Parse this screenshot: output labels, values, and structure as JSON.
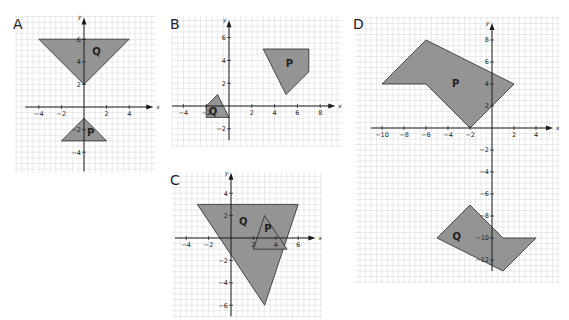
{
  "style": {
    "shape_fill": "#8e8e8e",
    "shape_stroke": "#2a2a2a",
    "grid_color": "#dcdcdc",
    "axis_color": "#1a1a1a",
    "text_color": "#222222"
  },
  "chart_data": [
    {
      "type": "diagram",
      "title": "A",
      "box": {
        "left": 15,
        "top": 16,
        "width": 141,
        "height": 157
      },
      "origin_px": [
        84,
        107
      ],
      "unit_px": 11.3,
      "grid_range": {
        "x": [
          -6,
          6
        ],
        "y": [
          -6,
          8
        ]
      },
      "x_ticks": [
        -4,
        -2,
        2,
        4
      ],
      "y_ticks": [
        6,
        4,
        2,
        -2,
        -4
      ],
      "axis_extent": {
        "x": [
          -5.2,
          5.6
        ],
        "y": [
          -5.7,
          7.4
        ]
      },
      "xlabel": "x",
      "ylabel": "y",
      "shapes": [
        {
          "label": "Q",
          "points": [
            [
              -4,
              6
            ],
            [
              4,
              6
            ],
            [
              0,
              2
            ]
          ],
          "label_pos": [
            1.1,
            4.6
          ]
        },
        {
          "label": "P",
          "points": [
            [
              0,
              -1
            ],
            [
              2,
              -3
            ],
            [
              -2,
              -3
            ]
          ],
          "label_pos": [
            0.6,
            -2.6
          ]
        }
      ]
    },
    {
      "type": "diagram",
      "title": "B",
      "box": {
        "left": 172,
        "top": 16,
        "width": 170,
        "height": 131
      },
      "origin_px": [
        229,
        106
      ],
      "unit_px": 11.4,
      "grid_range": {
        "x": [
          -5,
          10
        ],
        "y": [
          -4,
          8
        ]
      },
      "x_ticks": [
        -4,
        -2,
        2,
        4,
        6,
        8
      ],
      "y_ticks": [
        6,
        4,
        2,
        -2
      ],
      "axis_extent": {
        "x": [
          -5,
          8.8
        ],
        "y": [
          -3,
          7
        ]
      },
      "xlabel": "x",
      "ylabel": "y",
      "shapes": [
        {
          "label": "P",
          "points": [
            [
              3,
              5
            ],
            [
              7,
              5
            ],
            [
              7,
              3
            ],
            [
              5,
              1
            ]
          ],
          "label_pos": [
            5.3,
            3.4
          ]
        },
        {
          "label": "Q",
          "points": [
            [
              -2,
              0
            ],
            [
              -1,
              1
            ],
            [
              0,
              -1
            ],
            [
              -2,
              -1
            ]
          ],
          "label_pos": [
            -1.4,
            -0.8
          ]
        }
      ]
    },
    {
      "type": "diagram",
      "title": "C",
      "box": {
        "left": 172,
        "top": 172,
        "width": 150,
        "height": 146
      },
      "origin_px": [
        231,
        238
      ],
      "unit_px": 11.2,
      "grid_range": {
        "x": [
          -6,
          9
        ],
        "y": [
          -8,
          6
        ]
      },
      "x_ticks": [
        -4,
        -2,
        2,
        4,
        6
      ],
      "y_ticks": [
        4,
        2,
        -2,
        -4,
        -6
      ],
      "axis_extent": {
        "x": [
          -5,
          7
        ],
        "y": [
          -7,
          5.3
        ]
      },
      "xlabel": "x",
      "ylabel": "y",
      "shapes": [
        {
          "label": "Q",
          "points": [
            [
              -3,
              3
            ],
            [
              6,
              3
            ],
            [
              3,
              -6
            ]
          ],
          "label_pos": [
            1.1,
            1.2
          ]
        },
        {
          "label": "P",
          "points": [
            [
              3,
              2
            ],
            [
              5,
              -1
            ],
            [
              2,
              -1
            ]
          ],
          "label_pos": [
            3.3,
            0.5
          ]
        }
      ]
    },
    {
      "type": "diagram",
      "title": "D",
      "box": {
        "left": 355,
        "top": 16,
        "width": 204,
        "height": 267
      },
      "origin_px": [
        492,
        128
      ],
      "unit_px": 11,
      "grid_range": {
        "x": [
          -13,
          7
        ],
        "y": [
          -15,
          11
        ]
      },
      "x_ticks": [
        -10,
        -8,
        -6,
        -4,
        -2,
        2,
        4
      ],
      "y_ticks": [
        8,
        6,
        4,
        2,
        -2,
        -4,
        -6,
        -8,
        -10,
        -12
      ],
      "axis_extent": {
        "x": [
          -11,
          5
        ],
        "y": [
          -13,
          9
        ]
      },
      "xlabel": "x",
      "ylabel": "y",
      "shapes": [
        {
          "label": "P",
          "points": [
            [
              -10,
              4
            ],
            [
              -6,
              8
            ],
            [
              2,
              4
            ],
            [
              -2,
              0
            ],
            [
              -6,
              4
            ]
          ],
          "label_pos": [
            -3.3,
            3.7
          ]
        },
        {
          "label": "Q",
          "points": [
            [
              -2,
              -7
            ],
            [
              1,
              -10
            ],
            [
              4,
              -10
            ],
            [
              1,
              -13
            ],
            [
              -5,
              -10
            ]
          ],
          "label_pos": [
            -3.2,
            -10.2
          ]
        }
      ]
    }
  ]
}
